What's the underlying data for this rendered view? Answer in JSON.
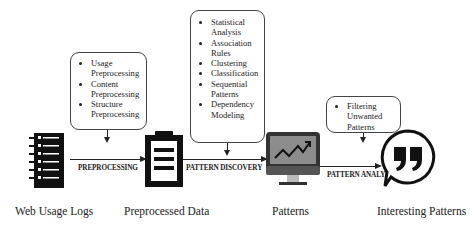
{
  "diagram": {
    "nodes": [
      {
        "id": "logs",
        "label": "Web Usage Logs",
        "icon": "log-list-icon"
      },
      {
        "id": "preprocessed",
        "label": "Preprocessed Data",
        "icon": "clipboard-icon"
      },
      {
        "id": "patterns",
        "label": "Patterns",
        "icon": "monitor-chart-icon"
      },
      {
        "id": "interesting",
        "label": "Interesting Patterns",
        "icon": "quote-bubble-icon"
      }
    ],
    "edges": [
      {
        "from": "logs",
        "to": "preprocessed",
        "label": "PREPROCESSING"
      },
      {
        "from": "preprocessed",
        "to": "patterns",
        "label": "PATTERN DISCOVERY"
      },
      {
        "from": "patterns",
        "to": "interesting",
        "label": "PATTERN ANALYSIS"
      }
    ],
    "boxes": {
      "preprocessing": [
        "Usage Preprocessing",
        "Content Preprocessing",
        "Structure Preprocessing"
      ],
      "discovery": [
        "Statistical Analysis",
        "Association Rules",
        "Clustering",
        "Classification",
        "Sequential Patterns",
        "Dependency Modeling"
      ],
      "analysis": [
        "Filtering Unwanted Patterns"
      ]
    }
  },
  "colors": {
    "line": "#222222",
    "box_border": "#444444",
    "monitor_screen": "#8c8c8c",
    "monitor_frame": "#333333"
  }
}
